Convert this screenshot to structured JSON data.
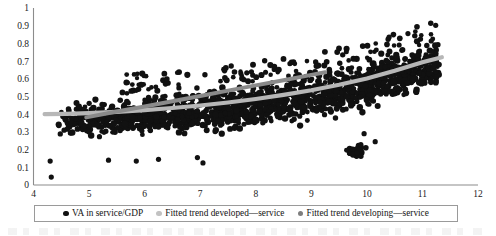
{
  "chart_data": {
    "type": "scatter",
    "title": "",
    "subtitle": "",
    "xlabel": "",
    "ylabel": "",
    "xlim": [
      4,
      12
    ],
    "ylim": [
      0,
      1
    ],
    "x_ticks": [
      "4",
      "5",
      "6",
      "7",
      "8",
      "9",
      "10",
      "11",
      "12"
    ],
    "y_ticks": [
      "0",
      "0.1",
      "0.2",
      "0.3",
      "0.4",
      "0.5",
      "0.6",
      "0.7",
      "0.8",
      "0.9",
      "1"
    ],
    "grid": false,
    "legend_position": "bottom",
    "series": [
      {
        "name": "VA in service/GDP",
        "type": "scatter",
        "color": "#111111",
        "marker": "circle",
        "description": "Dense cloud of country-year observations rising from about 0.30 at x=4.5 to about 0.60 at x=11.3, with scattered low outliers near 0.04-0.15 at x=4.3 and a low cluster near 0.15-0.25 at x=9.9-10.2"
      },
      {
        "name": "Fitted trend developed—service",
        "type": "line",
        "color": "#b7b7b7",
        "x": [
          4.2,
          4.6,
          5.0,
          5.5,
          6.0,
          6.5,
          7.0,
          7.5,
          8.0,
          8.5,
          9.0,
          9.5,
          10.0,
          10.5,
          11.0,
          11.35
        ],
        "y": [
          0.4,
          0.402,
          0.406,
          0.413,
          0.423,
          0.435,
          0.449,
          0.466,
          0.486,
          0.509,
          0.535,
          0.566,
          0.602,
          0.645,
          0.694,
          0.722
        ]
      },
      {
        "name": "Fitted trend developing—service",
        "type": "line",
        "color": "#8a8a8a",
        "x": [
          4.95,
          5.5,
          6.0,
          6.5,
          7.0,
          7.5,
          8.0,
          8.5,
          9.0,
          9.25
        ],
        "y": [
          0.382,
          0.415,
          0.444,
          0.473,
          0.503,
          0.533,
          0.563,
          0.592,
          0.622,
          0.637
        ]
      }
    ],
    "scatter_points": {
      "note": "x = log GDP per capita bins; y = value added in services as share of GDP",
      "x_range": [
        4.25,
        11.4
      ],
      "y_range": [
        0.03,
        0.79
      ],
      "n_approx": 1600
    }
  },
  "axes": {
    "y_labels": [
      "1",
      "0.9",
      "0.8",
      "0.7",
      "0.6",
      "0.5",
      "0.4",
      "0.3",
      "0.2",
      "0.1",
      "0"
    ],
    "x_labels": [
      "4",
      "5",
      "6",
      "7",
      "8",
      "9",
      "10",
      "11",
      "12"
    ]
  },
  "legend": {
    "items": [
      {
        "label": "VA in service/GDP",
        "color": "#111111"
      },
      {
        "label": "Fitted trend developed—service",
        "color": "#c2c2c2"
      },
      {
        "label": "Fitted trend developing—service",
        "color": "#7e7e7e"
      }
    ]
  },
  "colors": {
    "scatter": "#111111",
    "trend_developed": "#b7b7b7",
    "trend_developing": "#8a8a8a",
    "axis": "#8c8c8c",
    "text": "#141414"
  }
}
